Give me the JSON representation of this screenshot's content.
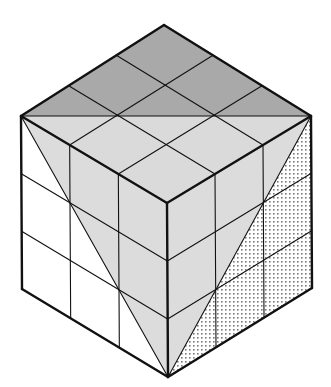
{
  "figure": {
    "grid_divisions": 3,
    "vertices": {
      "top": [
        164,
        25
      ],
      "left": [
        21,
        116
      ],
      "right": [
        311,
        116
      ],
      "front": [
        167,
        203
      ],
      "bottom": [
        168,
        377
      ],
      "bottom_left": [
        22,
        289
      ],
      "bottom_right": [
        312,
        288
      ]
    },
    "colors": {
      "line": "#111111",
      "top_back_triangle": "#a9a9a9",
      "top_front_triangle": "#dadada",
      "left_inner_region": "#dcdcdc",
      "left_outer_region": "#ffffff",
      "right_inner_region": "#dcdcdc",
      "right_outer_dots": "#7a7a7a",
      "background": "#ffffff"
    }
  }
}
